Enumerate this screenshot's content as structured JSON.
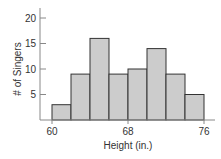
{
  "chart_data": {
    "type": "bar",
    "subtype": "histogram",
    "title": "",
    "xlabel": "Height (in.)",
    "ylabel": "# of Singers",
    "bin_edges": [
      60,
      62,
      64,
      66,
      68,
      70,
      72,
      74,
      76
    ],
    "categories": [
      "60-62",
      "62-64",
      "64-66",
      "66-68",
      "68-70",
      "70-72",
      "72-74",
      "74-76"
    ],
    "values": [
      3,
      9,
      16,
      9,
      10,
      14,
      9,
      5
    ],
    "xlim": [
      58.5,
      77.5
    ],
    "ylim": [
      0,
      21
    ],
    "x_ticks": [
      60,
      68,
      76
    ],
    "x_tick_labels": [
      "60",
      "68",
      "76"
    ],
    "y_ticks": [
      5,
      10,
      15,
      20
    ],
    "y_tick_labels": [
      "5",
      "10",
      "15",
      "20"
    ],
    "grid": false,
    "legend": null,
    "colors": {
      "bar_fill": "#cccccc",
      "bar_edge": "#333333",
      "axis": "#888888"
    }
  }
}
